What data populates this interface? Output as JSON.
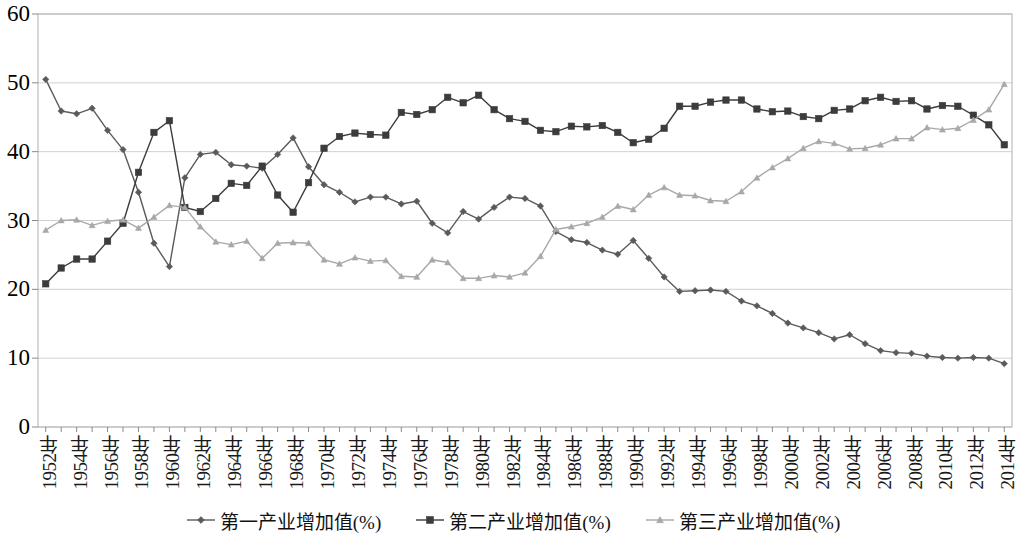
{
  "chart_data": {
    "type": "line",
    "title": "",
    "subtitle": "",
    "xlabel": "",
    "ylabel": "",
    "ylim": [
      0,
      60
    ],
    "ytick_step": 10,
    "ytick_labels": [
      "0",
      "10",
      "20",
      "30",
      "40",
      "50",
      "60"
    ],
    "grid": true,
    "grid_axis": "y",
    "legend_position": "bottom",
    "x_tick_label_interval": 2,
    "x": [
      1952,
      1953,
      1954,
      1955,
      1956,
      1957,
      1958,
      1959,
      1960,
      1961,
      1962,
      1963,
      1964,
      1965,
      1966,
      1967,
      1968,
      1969,
      1970,
      1971,
      1972,
      1973,
      1974,
      1975,
      1976,
      1977,
      1978,
      1979,
      1980,
      1981,
      1982,
      1983,
      1984,
      1985,
      1986,
      1987,
      1988,
      1989,
      1990,
      1991,
      1992,
      1993,
      1994,
      1995,
      1996,
      1997,
      1998,
      1999,
      2000,
      2001,
      2002,
      2003,
      2004,
      2005,
      2006,
      2007,
      2008,
      2009,
      2010,
      2011,
      2012,
      2013,
      2014
    ],
    "xtick_labels": [
      "1952年",
      "1953年",
      "1954年",
      "1955年",
      "1956年",
      "1957年",
      "1958年",
      "1959年",
      "1960年",
      "1961年",
      "1962年",
      "1963年",
      "1964年",
      "1965年",
      "1966年",
      "1967年",
      "1968年",
      "1969年",
      "1970年",
      "1971年",
      "1972年",
      "1973年",
      "1974年",
      "1975年",
      "1976年",
      "1977年",
      "1978年",
      "1979年",
      "1980年",
      "1981年",
      "1982年",
      "1983年",
      "1984年",
      "1985年",
      "1986年",
      "1987年",
      "1988年",
      "1989年",
      "1990年",
      "1991年",
      "1992年",
      "1993年",
      "1994年",
      "1995年",
      "1996年",
      "1997年",
      "1998年",
      "1999年",
      "2000年",
      "2001年",
      "2002年",
      "2003年",
      "2004年",
      "2005年",
      "2006年",
      "2007年",
      "2008年",
      "2009年",
      "2010年",
      "2011年",
      "2012年",
      "2013年",
      "2014年"
    ],
    "xtick_labels_shown": [
      "1952年",
      "1954年",
      "1956年",
      "1958年",
      "1960年",
      "1962年",
      "1964年",
      "1966年",
      "1968年",
      "1970年",
      "1972年",
      "1974年",
      "1976年",
      "1978年",
      "1980年",
      "1982年",
      "1984年",
      "1986年",
      "1988年",
      "1990年",
      "1992年",
      "1994年",
      "1996年",
      "1998年",
      "2000年",
      "2002年",
      "2004年",
      "2006年",
      "2008年",
      "2010年",
      "2012年",
      "2014年"
    ],
    "series": [
      {
        "name": "第一产业增加值(%)",
        "color": "#5a5a5a",
        "marker": "diamond",
        "values": [
          50.5,
          45.9,
          45.5,
          46.3,
          43.1,
          40.3,
          34.1,
          26.7,
          23.3,
          36.2,
          39.6,
          39.9,
          38.1,
          37.9,
          37.6,
          39.6,
          42.0,
          37.8,
          35.2,
          34.1,
          32.7,
          33.4,
          33.4,
          32.4,
          32.8,
          29.6,
          28.2,
          31.3,
          30.2,
          31.9,
          33.4,
          33.2,
          32.1,
          28.4,
          27.2,
          26.8,
          25.7,
          25.1,
          27.1,
          24.5,
          21.8,
          19.7,
          19.8,
          19.9,
          19.7,
          18.3,
          17.6,
          16.5,
          15.1,
          14.4,
          13.7,
          12.8,
          13.4,
          12.1,
          11.1,
          10.8,
          10.7,
          10.3,
          10.1,
          10.0,
          10.1,
          10.0,
          9.2
        ]
      },
      {
        "name": "第二产业增加值(%)",
        "color": "#3c3c3c",
        "marker": "square",
        "values": [
          20.8,
          23.1,
          24.4,
          24.4,
          27.0,
          29.6,
          37.0,
          42.8,
          44.5,
          31.9,
          31.3,
          33.2,
          35.4,
          35.1,
          37.9,
          33.7,
          31.2,
          35.5,
          40.5,
          42.2,
          42.7,
          42.5,
          42.4,
          45.7,
          45.4,
          46.1,
          47.9,
          47.1,
          48.2,
          46.1,
          44.8,
          44.4,
          43.1,
          42.9,
          43.7,
          43.6,
          43.8,
          42.8,
          41.3,
          41.8,
          43.4,
          46.6,
          46.6,
          47.2,
          47.5,
          47.5,
          46.2,
          45.8,
          45.9,
          45.1,
          44.8,
          46.0,
          46.2,
          47.4,
          47.9,
          47.3,
          47.4,
          46.2,
          46.7,
          46.6,
          45.3,
          43.9,
          41.0
        ]
      },
      {
        "name": "第三产业增加值(%)",
        "color": "#a8a8a8",
        "marker": "triangle",
        "values": [
          28.6,
          30.0,
          30.1,
          29.3,
          29.9,
          30.1,
          28.9,
          30.5,
          32.2,
          31.9,
          29.1,
          26.9,
          26.5,
          27.0,
          24.5,
          26.7,
          26.8,
          26.7,
          24.3,
          23.7,
          24.6,
          24.1,
          24.2,
          21.9,
          21.8,
          24.3,
          23.9,
          21.6,
          21.6,
          22.0,
          21.8,
          22.4,
          24.8,
          28.7,
          29.1,
          29.6,
          30.5,
          32.1,
          31.6,
          33.7,
          34.8,
          33.7,
          33.6,
          32.9,
          32.8,
          34.2,
          36.2,
          37.7,
          39.0,
          40.5,
          41.5,
          41.2,
          40.4,
          40.5,
          41.0,
          41.9,
          41.9,
          43.5,
          43.2,
          43.4,
          44.6,
          46.1,
          49.8
        ]
      }
    ]
  },
  "legend": {
    "items": [
      {
        "label": "第一产业增加值(%)",
        "color": "#5a5a5a",
        "marker": "diamond"
      },
      {
        "label": "第二产业增加值(%)",
        "color": "#3c3c3c",
        "marker": "square"
      },
      {
        "label": "第三产业增加值(%)",
        "color": "#a8a8a8",
        "marker": "triangle"
      }
    ]
  },
  "axes": {
    "plot_left": 38,
    "plot_right": 1012,
    "plot_top": 14,
    "plot_bottom": 427,
    "border_color": "#b0b0b0",
    "grid_color": "#d0d0d0"
  }
}
